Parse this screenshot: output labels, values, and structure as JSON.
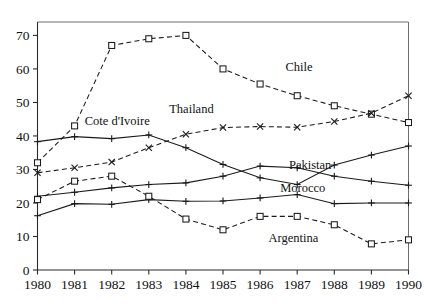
{
  "chart_data": {
    "type": "line",
    "title": "",
    "xlabel": "",
    "ylabel": "",
    "x": [
      1980,
      1981,
      1982,
      1983,
      1984,
      1985,
      1986,
      1987,
      1988,
      1989,
      1990
    ],
    "categories": [
      "1980",
      "1981",
      "1982",
      "1983",
      "1984",
      "1985",
      "1986",
      "1987",
      "1988",
      "1989",
      "1990"
    ],
    "xlim": [
      1980,
      1990
    ],
    "ylim": [
      0,
      74
    ],
    "yticks": [
      0,
      10,
      20,
      30,
      40,
      50,
      60,
      70
    ],
    "ytick_labels": [
      "0",
      "10",
      "20",
      "30",
      "40",
      "50",
      "60",
      "70"
    ],
    "xticks": [
      1980,
      1981,
      1982,
      1983,
      1984,
      1985,
      1986,
      1987,
      1988,
      1989,
      1990
    ],
    "xtick_labels": [
      "1980",
      "1981",
      "1982",
      "1983",
      "1984",
      "1985",
      "1986",
      "1987",
      "1988",
      "1989",
      "1990"
    ],
    "grid": false,
    "legend": "inline-annotations",
    "legend_position": "inline",
    "series": [
      {
        "name": "Chile",
        "label": "Chile",
        "linestyle": "dashed",
        "marker": "square",
        "color": "#1a1a1a",
        "values": [
          32,
          43,
          67,
          69,
          70,
          60,
          55.5,
          52,
          49,
          46.5,
          44
        ],
        "label_x": 1987.05,
        "label_y": 59.5
      },
      {
        "name": "Thailand",
        "label": "Thailand",
        "linestyle": "dashed",
        "marker": "x",
        "color": "#1a1a1a",
        "values": [
          29,
          30.5,
          32.2,
          36.5,
          40.5,
          42.5,
          42.8,
          42.6,
          44.3,
          46.8,
          52
        ],
        "label_x": 1984.15,
        "label_y": 46.8
      },
      {
        "name": "Cote d'Ivoire",
        "label": "Cote d'Ivoire",
        "linestyle": "solid",
        "marker": "plus",
        "color": "#1a1a1a",
        "values": [
          38.3,
          39.8,
          39.2,
          40.3,
          36.5,
          31.5,
          27.5,
          25.5,
          31.3,
          34.3,
          37
        ],
        "label_x": 1982.15,
        "label_y": 43.3
      },
      {
        "name": "Pakistan",
        "label": "Pakistan",
        "linestyle": "solid",
        "marker": "plus",
        "color": "#1a1a1a",
        "values": [
          22,
          23.2,
          24.5,
          25.5,
          26,
          28,
          31,
          30.5,
          28,
          26.5,
          25.3
        ],
        "label_x": 1987.35,
        "label_y": 30.2
      },
      {
        "name": "Morocco",
        "label": "Morocco",
        "linestyle": "solid",
        "marker": "plus",
        "color": "#1a1a1a",
        "values": [
          16.2,
          19.8,
          19.6,
          21,
          20.5,
          20.6,
          21.5,
          22.5,
          19.8,
          20,
          20
        ],
        "label_x": 1987.15,
        "label_y": 23.2
      },
      {
        "name": "Argentina",
        "label": "Argentina",
        "linestyle": "dashed",
        "marker": "square",
        "color": "#1a1a1a",
        "values": [
          21,
          26.5,
          28,
          22,
          15.2,
          12,
          16,
          16,
          13.5,
          7.8,
          9
        ],
        "label_x": 1986.9,
        "label_y": 8.5
      }
    ]
  }
}
